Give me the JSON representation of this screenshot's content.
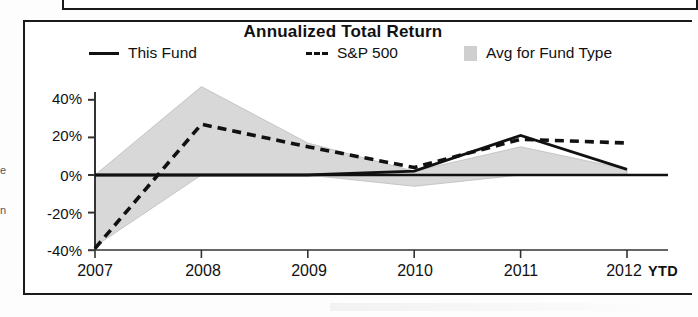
{
  "chart_data": {
    "type": "line",
    "title": "Annualized Total Return",
    "xlabel": "",
    "ylabel": "",
    "categories": [
      "2007",
      "2008",
      "2009",
      "2010",
      "2011",
      "2012"
    ],
    "x_axis_note": "YTD",
    "ylim": [
      -40,
      48
    ],
    "ytick_labels": [
      "40%",
      "20%",
      "0%",
      "-20%",
      "-40%"
    ],
    "ytick_values": [
      40,
      20,
      0,
      -20,
      -40
    ],
    "grid": false,
    "legend_position": "top",
    "zero_line": true,
    "series": [
      {
        "name": "This Fund",
        "style": "solid",
        "color": "#111111",
        "values": [
          0,
          0,
          0,
          2,
          21,
          3
        ]
      },
      {
        "name": "S&P 500",
        "style": "dashed",
        "color": "#111111",
        "values": [
          -39,
          27,
          15,
          4,
          19,
          17
        ]
      },
      {
        "name": "Avg for Fund Type",
        "style": "area",
        "color": "#d6d6d6",
        "values_upper": [
          0,
          47,
          17,
          2,
          15,
          3
        ],
        "values_lower": [
          -38,
          0,
          0,
          -6,
          0,
          0
        ]
      }
    ]
  },
  "chart": {
    "title": "Annualized Total Return",
    "legend": [
      {
        "label": "This Fund",
        "marker": "solid-line-swatch"
      },
      {
        "label": "S&P 500",
        "marker": "dashed-line-swatch",
        "prefix": "---"
      },
      {
        "label": "Avg for Fund Type",
        "marker": "gray-area-swatch"
      }
    ],
    "y_axis": {
      "ticks": [
        "40%",
        "20%",
        "0%",
        "-20%",
        "-40%"
      ]
    },
    "x_axis": {
      "ticks": [
        "2007",
        "2008",
        "2009",
        "2010",
        "2011",
        "2012"
      ],
      "suffix_label": "YTD"
    }
  },
  "margin_text": {
    "line1": "e",
    "line2": "n"
  }
}
